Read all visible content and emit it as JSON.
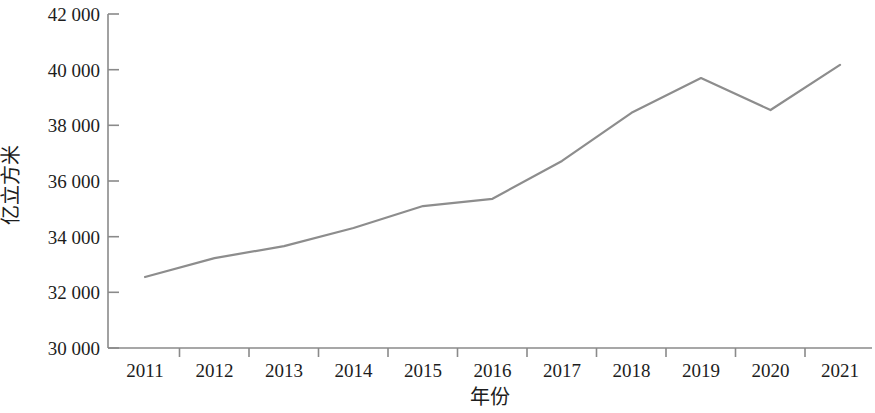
{
  "chart_data": {
    "type": "line",
    "title": "",
    "xlabel": "年份",
    "ylabel": "亿立方米",
    "categories": [
      "2011",
      "2012",
      "2013",
      "2014",
      "2015",
      "2016",
      "2017",
      "2018",
      "2019",
      "2020",
      "2021"
    ],
    "series": [
      {
        "name": "用水总量",
        "color": "#8d8d8d",
        "values": [
          32550,
          33230,
          33660,
          34310,
          35100,
          35360,
          36720,
          38450,
          39700,
          38550,
          40170
        ]
      }
    ],
    "ylim": [
      30000,
      42000
    ],
    "ytick_values": [
      30000,
      32000,
      34000,
      36000,
      38000,
      40000,
      42000
    ],
    "ytick_labels": [
      "30 000",
      "32 000",
      "34 000",
      "36 000",
      "38 000",
      "40 000",
      "42 000"
    ],
    "xtick_labels": [
      "2011",
      "2012",
      "2013",
      "2014",
      "2015",
      "2016",
      "2017",
      "2018",
      "2019",
      "2020",
      "2021"
    ],
    "grid": false,
    "legend": false,
    "legend_position": "none",
    "line_color": "#8d8d8d",
    "axis_color": "#8a8a8a",
    "background_color": "#ffffff"
  }
}
